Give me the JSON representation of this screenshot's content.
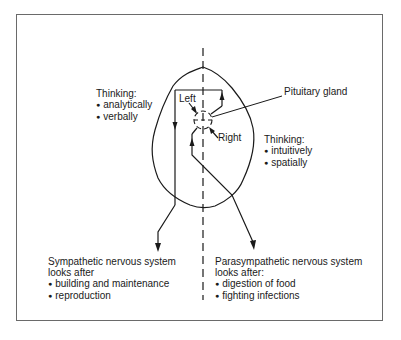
{
  "diagram": {
    "type": "brain hemispheres and nervous system diagram",
    "labels": {
      "left_thinking": {
        "heading": "Thinking:",
        "items": [
          "analytically",
          "verbally"
        ]
      },
      "right_thinking": {
        "heading": "Thinking:",
        "items": [
          "intuitively",
          "spatially"
        ]
      },
      "left": "Left",
      "right": "Right",
      "pituitary": "Pituitary gland",
      "sympathetic": {
        "line1": "Sympathetic nervous system",
        "line2": "looks after",
        "items": [
          "building and maintenance",
          "reproduction"
        ]
      },
      "parasympathetic": {
        "line1": "Parasympathetic nervous system",
        "line2": "looks after:",
        "items": [
          "digestion of food",
          "fighting infections"
        ]
      }
    },
    "colors": {
      "line": "#1a1a1a",
      "frame": "#6a6a6a",
      "background": "#ffffff"
    }
  }
}
